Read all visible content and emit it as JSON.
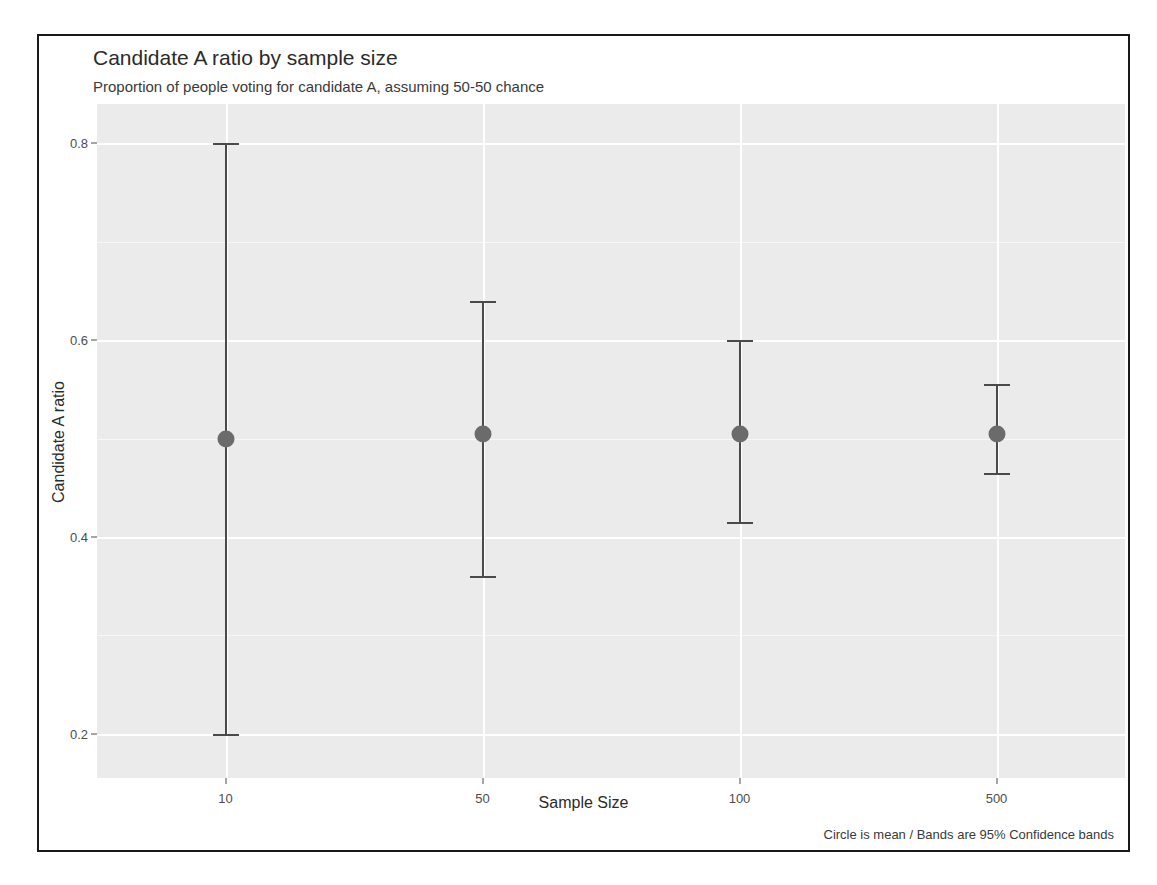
{
  "chart_data": {
    "type": "scatter",
    "title": "Candidate A ratio by sample size",
    "subtitle": "Proportion of people voting for candidate A, assuming 50-50 chance",
    "caption": "Circle is mean / Bands are 95% Confidence bands",
    "xlabel": "Sample Size",
    "ylabel": "Candidate A ratio",
    "categories": [
      "10",
      "50",
      "100",
      "500"
    ],
    "values": [
      0.5,
      0.505,
      0.505,
      0.505
    ],
    "error_low": [
      0.2,
      0.36,
      0.415,
      0.465
    ],
    "error_high": [
      0.8,
      0.64,
      0.6,
      0.555
    ],
    "ylim": [
      0.155,
      0.84
    ],
    "yticks": [
      "0.2",
      "0.4",
      "0.6",
      "0.8"
    ],
    "ytick_values": [
      0.2,
      0.4,
      0.6,
      0.8
    ],
    "grid": true,
    "legend": "none",
    "points": [
      {
        "category": "10",
        "mean": 0.5,
        "low": 0.2,
        "high": 0.8
      },
      {
        "category": "50",
        "mean": 0.505,
        "low": 0.36,
        "high": 0.64
      },
      {
        "category": "100",
        "mean": 0.505,
        "low": 0.415,
        "high": 0.6
      },
      {
        "category": "500",
        "mean": 0.505,
        "low": 0.465,
        "high": 0.555
      }
    ]
  },
  "colors": {
    "panel_background": "#ebebeb",
    "grid_major": "#ffffff",
    "point": "#6b6b6b",
    "errorbar": "#4a4a4a",
    "border": "#1a1a1a",
    "text": "#2b2b2b"
  }
}
